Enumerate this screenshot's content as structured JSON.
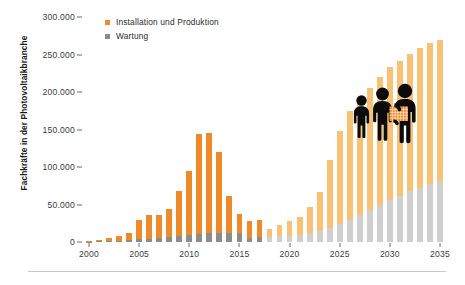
{
  "chart_data": {
    "type": "bar",
    "title": "",
    "subtitle": "",
    "xlabel": "",
    "ylabel": "Fachkräfte in der Photovoltaikbranche",
    "ylim": [
      0,
      300000
    ],
    "ytick_labels": [
      "0",
      "50.000",
      "100.000",
      "150.000",
      "200.000",
      "250.000",
      "300.000"
    ],
    "ytick_values": [
      0,
      50000,
      100000,
      150000,
      200000,
      250000,
      300000
    ],
    "grid": false,
    "stacked": true,
    "legend_position": "top-left",
    "categories": [
      "2000",
      "2001",
      "2002",
      "2003",
      "2004",
      "2005",
      "2006",
      "2007",
      "2008",
      "2009",
      "2010",
      "2011",
      "2012",
      "2013",
      "2014",
      "2015",
      "2016",
      "2017",
      "2018",
      "2019",
      "2020",
      "2021",
      "2022",
      "2023",
      "2024",
      "2025",
      "2026",
      "2027",
      "2028",
      "2029",
      "2030",
      "2031",
      "2032",
      "2033",
      "2034",
      "2035"
    ],
    "xtick_labels": [
      "2000",
      "2005",
      "2010",
      "2015",
      "2020",
      "2025",
      "2030",
      "2035"
    ],
    "series": [
      {
        "name": "Wartung",
        "color_historic": "#8c8c8c",
        "color_forecast": "#cfcfcf",
        "values": [
          500,
          800,
          1200,
          1800,
          2600,
          3400,
          4200,
          5200,
          6400,
          7600,
          9200,
          10800,
          11800,
          12400,
          12600,
          12600,
          6000,
          6600,
          6800,
          7400,
          8200,
          9600,
          11600,
          14500,
          18500,
          24000,
          30000,
          36500,
          43000,
          49500,
          56000,
          62000,
          67500,
          72500,
          77000,
          81000
        ]
      },
      {
        "name": "Installation und Produktion",
        "color_historic": "#f08a28",
        "color_forecast": "#f8c173",
        "values": [
          1500,
          2200,
          4300,
          6200,
          9400,
          25600,
          31800,
          30800,
          38200,
          60600,
          85800,
          133200,
          133200,
          107600,
          48400,
          24400,
          22000,
          23400,
          11200,
          15600,
          19800,
          24400,
          34800,
          52500,
          90500,
          124000,
          145000,
          153500,
          163000,
          170500,
          177000,
          180000,
          183500,
          186500,
          188000,
          189000
        ]
      }
    ],
    "series_totals": [
      2000,
      3000,
      5500,
      8000,
      12000,
      29000,
      36000,
      36000,
      44600,
      68200,
      95000,
      144000,
      145000,
      120000,
      61000,
      37000,
      28000,
      30000,
      18000,
      23000,
      28000,
      34000,
      46400,
      67000,
      109000,
      148000,
      175000,
      190000,
      206000,
      220000,
      233000,
      242000,
      251000,
      259000,
      265000,
      270000
    ],
    "forecast_start_category": "2018",
    "annotations": [
      {
        "name": "worker-pictograms",
        "description": "Drei schwarze Personen-Piktogramme, die größte hält ein oranges Solarmodul"
      }
    ]
  },
  "legend": {
    "items": [
      {
        "label": "Installation und Produktion",
        "color": "#f08a28"
      },
      {
        "label": "Wartung",
        "color": "#8c8c8c"
      }
    ]
  },
  "axis": {
    "y_title": "Fachkräfte in der Photovoltaikbranche"
  }
}
